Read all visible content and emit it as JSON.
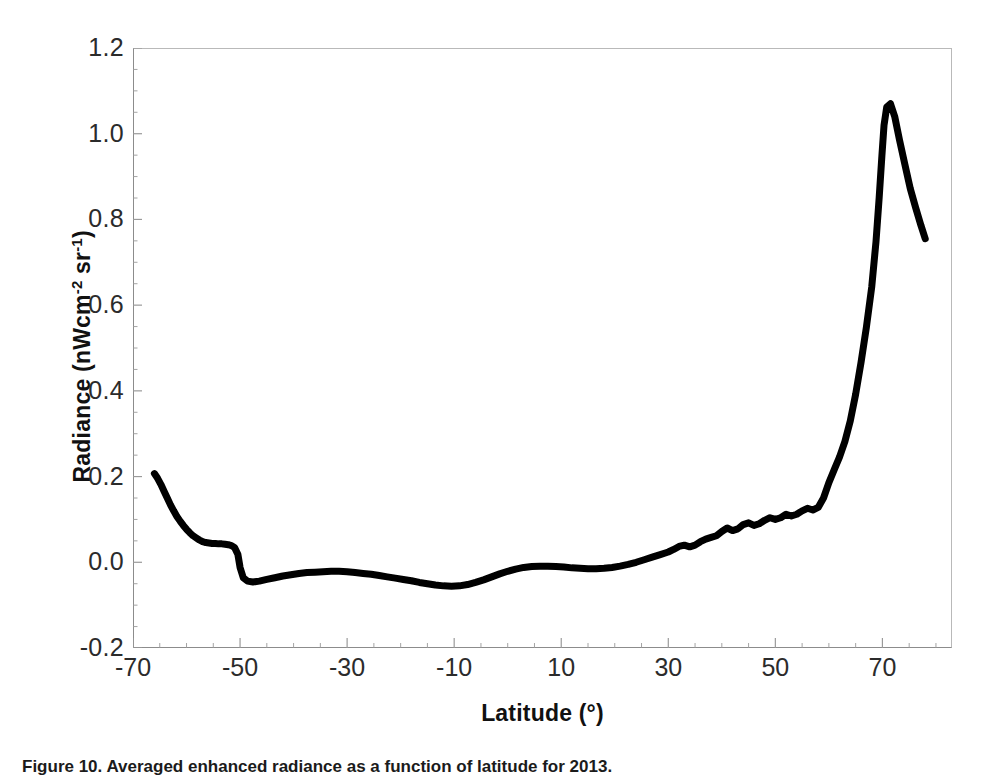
{
  "figure": {
    "caption": "Figure 10. Averaged enhanced radiance as a function of latitude for 2013."
  },
  "chart_data": {
    "type": "line",
    "title": "",
    "xlabel": "Latitude (°)",
    "ylabel_text": "Radiance (nWcm",
    "ylabel_sup1": "-2",
    "ylabel_mid": " sr",
    "ylabel_sup2": "-1",
    "ylabel_end": ")",
    "ylabel_plain": "Radiance (nWcm-2 sr-1)",
    "xlim": [
      -70,
      83
    ],
    "ylim": [
      -0.2,
      1.2
    ],
    "xticks": [
      -70,
      -50,
      -30,
      -10,
      10,
      30,
      50,
      70
    ],
    "xtick_labels": [
      "-70",
      "-50",
      "-30",
      "-10",
      "10",
      "30",
      "50",
      "70"
    ],
    "yticks": [
      -0.2,
      0.0,
      0.2,
      0.4,
      0.6,
      0.8,
      1.0,
      1.2
    ],
    "ytick_labels": [
      "-0.2",
      "0.0",
      "0.2",
      "0.4",
      "0.6",
      "0.8",
      "1.0",
      "1.2"
    ],
    "minor_ticks": true,
    "grid": false,
    "legend": false,
    "line_color": "#000000",
    "line_width": 7,
    "series": [
      {
        "name": "Averaged enhanced radiance",
        "x": [
          -66.0,
          -65.4,
          -64.8,
          -64.2,
          -63.6,
          -63.0,
          -62.4,
          -61.8,
          -61.2,
          -60.6,
          -60.0,
          -59.4,
          -58.8,
          -58.2,
          -57.6,
          -57.0,
          -56.4,
          -55.8,
          -55.2,
          -54.6,
          -54.0,
          -53.4,
          -52.8,
          -52.2,
          -51.6,
          -51.0,
          -50.4,
          -50.0,
          -49.4,
          -48.6,
          -47.6,
          -46.4,
          -45.0,
          -43.5,
          -42.0,
          -40.5,
          -39.0,
          -37.5,
          -36.0,
          -34.5,
          -33.0,
          -31.5,
          -30.0,
          -28.5,
          -27.0,
          -25.5,
          -24.0,
          -22.5,
          -21.0,
          -19.5,
          -18.0,
          -16.5,
          -15.0,
          -13.5,
          -12.0,
          -10.5,
          -9.0,
          -7.5,
          -6.0,
          -4.5,
          -3.0,
          -1.5,
          0.0,
          1.5,
          3.0,
          4.5,
          6.0,
          7.5,
          9.0,
          10.5,
          12.0,
          13.5,
          15.0,
          16.5,
          18.0,
          19.5,
          21.0,
          22.5,
          24.0,
          25.5,
          27.0,
          28.5,
          30.0,
          31.0,
          32.0,
          33.0,
          34.0,
          35.0,
          36.0,
          37.0,
          38.0,
          39.0,
          40.0,
          41.0,
          42.0,
          43.0,
          44.0,
          45.0,
          46.0,
          47.0,
          48.0,
          49.0,
          50.0,
          51.0,
          52.0,
          53.0,
          54.0,
          55.0,
          56.0,
          57.0,
          58.0,
          59.0,
          60.0,
          61.0,
          62.0,
          63.0,
          64.0,
          65.0,
          66.0,
          67.0,
          68.0,
          68.8,
          69.4,
          69.9,
          70.3,
          70.8,
          71.5,
          72.3,
          73.2,
          74.2,
          75.2,
          76.2,
          77.2,
          78.0
        ],
        "y": [
          0.207,
          0.196,
          0.182,
          0.166,
          0.15,
          0.134,
          0.12,
          0.107,
          0.096,
          0.086,
          0.077,
          0.069,
          0.062,
          0.057,
          0.052,
          0.048,
          0.046,
          0.045,
          0.044,
          0.044,
          0.043,
          0.043,
          0.042,
          0.041,
          0.039,
          0.034,
          0.018,
          -0.012,
          -0.036,
          -0.044,
          -0.046,
          -0.044,
          -0.04,
          -0.036,
          -0.032,
          -0.029,
          -0.026,
          -0.024,
          -0.023,
          -0.022,
          -0.021,
          -0.021,
          -0.022,
          -0.024,
          -0.026,
          -0.028,
          -0.031,
          -0.034,
          -0.037,
          -0.04,
          -0.043,
          -0.047,
          -0.05,
          -0.053,
          -0.055,
          -0.056,
          -0.055,
          -0.052,
          -0.047,
          -0.041,
          -0.034,
          -0.027,
          -0.021,
          -0.016,
          -0.012,
          -0.01,
          -0.009,
          -0.009,
          -0.01,
          -0.011,
          -0.013,
          -0.014,
          -0.015,
          -0.015,
          -0.014,
          -0.012,
          -0.009,
          -0.005,
          0.0,
          0.006,
          0.012,
          0.018,
          0.024,
          0.03,
          0.037,
          0.04,
          0.036,
          0.04,
          0.048,
          0.054,
          0.058,
          0.062,
          0.072,
          0.08,
          0.074,
          0.078,
          0.088,
          0.092,
          0.086,
          0.09,
          0.098,
          0.104,
          0.1,
          0.104,
          0.112,
          0.108,
          0.112,
          0.12,
          0.126,
          0.122,
          0.128,
          0.15,
          0.186,
          0.216,
          0.246,
          0.282,
          0.33,
          0.392,
          0.466,
          0.548,
          0.642,
          0.748,
          0.852,
          0.948,
          1.02,
          1.062,
          1.07,
          1.04,
          0.985,
          0.928,
          0.872,
          0.828,
          0.786,
          0.755
        ]
      }
    ]
  }
}
